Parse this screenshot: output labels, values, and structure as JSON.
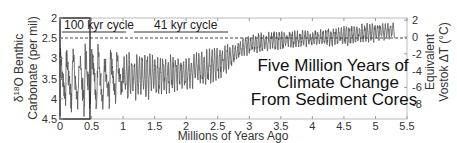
{
  "chart_data": {
    "type": "line",
    "title_lines": [
      "Five Million Years of",
      "Climate Change",
      "From Sediment Cores"
    ],
    "xlabel": "Millions of Years Ago",
    "ylabel_left": [
      "δ18O Benthic",
      "Carbonate (per mil)"
    ],
    "ylabel_right": [
      "Equivalent",
      "Vostok ΔT (°C)"
    ],
    "xlim": [
      0,
      5.5
    ],
    "ylim_left": [
      4.5,
      2
    ],
    "ylim_right": [
      -10.5,
      2.6
    ],
    "x_ticks": [
      "0",
      "0.5",
      "1",
      "1.5",
      "2",
      "2.5",
      "3",
      "3.5",
      "4",
      "4.5",
      "5",
      "5.5"
    ],
    "y_ticks_left": [
      "2",
      "2.5",
      "3",
      "3.5",
      "4",
      "4.5"
    ],
    "y_ticks_right": [
      "2",
      "0",
      "-2",
      "-4",
      "-6",
      "-8"
    ],
    "annotations": [
      {
        "text": "100 kyr cycle",
        "x_range": [
          0,
          1.0
        ]
      },
      {
        "text": "41 kyr cycle",
        "x_range": [
          1.2,
          2.65
        ]
      }
    ],
    "reference_line": {
      "style": "dashed",
      "y_left": 2.5,
      "y_right": 0
    },
    "highlight_box": {
      "x_range": [
        0,
        0.47
      ],
      "y_range": [
        2,
        4.5
      ]
    },
    "series": [
      {
        "name": "δ18O benthic carbonate",
        "envelope": [
          {
            "x": 0.0,
            "min": 2.6,
            "max": 4.4
          },
          {
            "x": 0.5,
            "min": 2.6,
            "max": 4.5
          },
          {
            "x": 1.0,
            "min": 2.8,
            "max": 4.1
          },
          {
            "x": 1.5,
            "min": 2.9,
            "max": 4.0
          },
          {
            "x": 2.0,
            "min": 2.9,
            "max": 3.8
          },
          {
            "x": 2.5,
            "min": 2.7,
            "max": 3.6
          },
          {
            "x": 2.8,
            "min": 2.6,
            "max": 3.1
          },
          {
            "x": 3.0,
            "min": 2.4,
            "max": 2.9
          },
          {
            "x": 3.5,
            "min": 2.3,
            "max": 2.8
          },
          {
            "x": 4.0,
            "min": 2.3,
            "max": 2.7
          },
          {
            "x": 4.5,
            "min": 2.2,
            "max": 2.7
          },
          {
            "x": 5.0,
            "min": 2.1,
            "max": 2.6
          },
          {
            "x": 5.3,
            "min": 2.1,
            "max": 2.5
          }
        ]
      }
    ]
  }
}
